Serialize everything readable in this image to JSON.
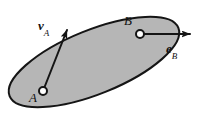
{
  "figure": {
    "type": "rigid-body-kinematics-diagram",
    "background_color": "#ffffff",
    "body": {
      "name": "ellipse-body",
      "shape": "ellipse",
      "fill_color": "#b6b6b6",
      "stroke_color": "#151515",
      "stroke_width": 2,
      "center_x": 94,
      "center_y": 62,
      "radius_x": 91,
      "radius_y": 32,
      "rotation_deg": -22
    },
    "points": [
      {
        "id": "A",
        "label": "A",
        "marker": "open-circle",
        "x": 43,
        "y": 91,
        "radius": 4,
        "label_x": 29,
        "label_y": 91
      },
      {
        "id": "B",
        "label": "B",
        "marker": "open-circle",
        "x": 140,
        "y": 34,
        "radius": 4,
        "label_x": 124,
        "label_y": 14
      }
    ],
    "vectors": [
      {
        "id": "vA",
        "label_base": "v",
        "label_sub": "A",
        "origin_x": 43,
        "origin_y": 91,
        "tip_x": 68,
        "tip_y": 28,
        "stroke_color": "#151515",
        "stroke_width": 2,
        "label_x": 38,
        "label_y": 19
      },
      {
        "id": "eB",
        "label_base": "e",
        "label_sub": "B",
        "origin_x": 140,
        "origin_y": 34,
        "tip_x": 193,
        "tip_y": 34,
        "stroke_color": "#151515",
        "stroke_width": 2,
        "label_x": 166,
        "label_y": 42
      }
    ]
  }
}
